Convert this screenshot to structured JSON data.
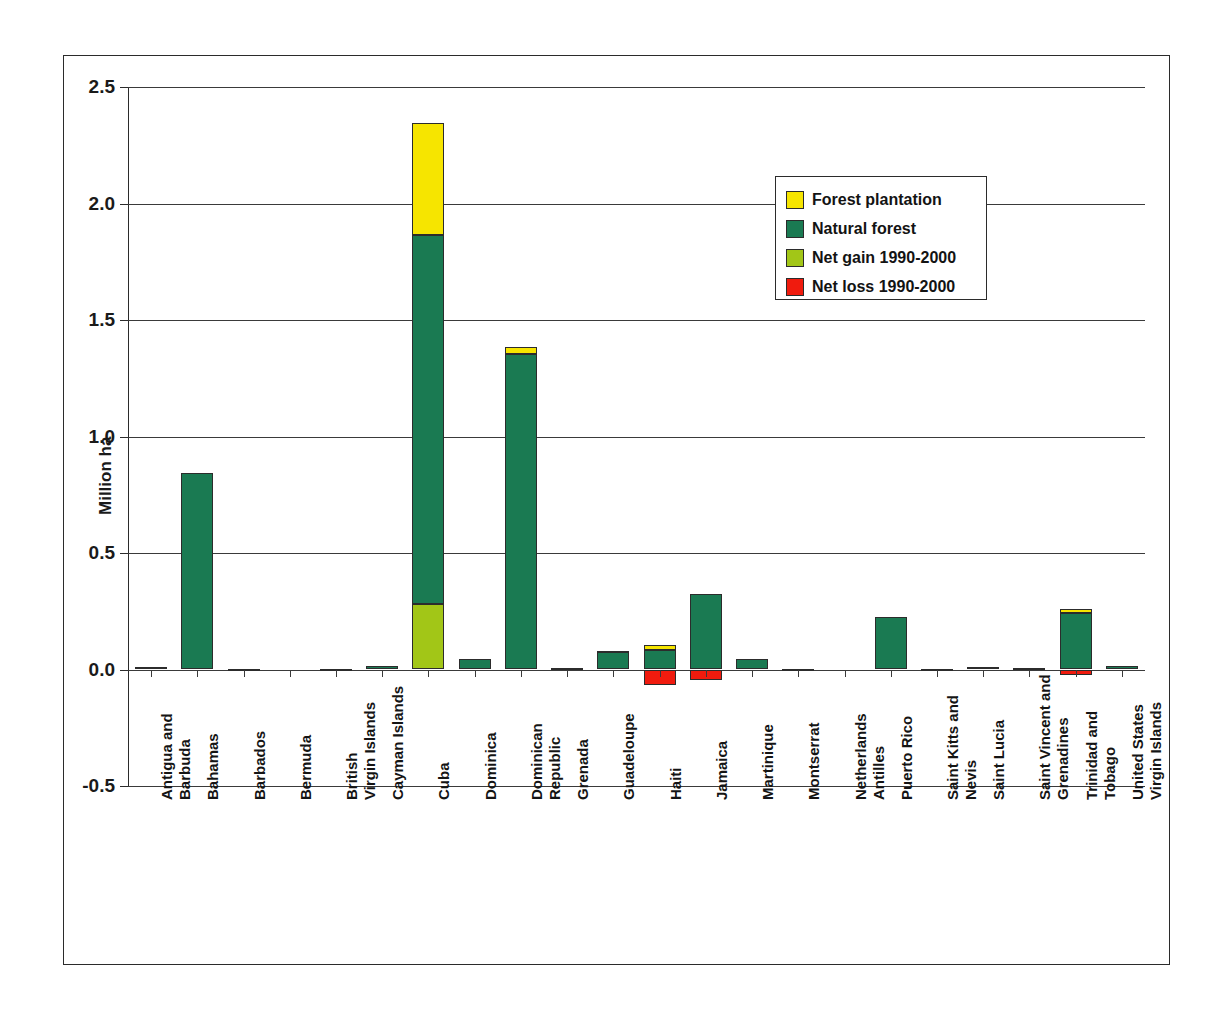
{
  "chart_data": {
    "type": "bar",
    "subtype": "stacked-with-negative",
    "title": "",
    "xlabel": "",
    "ylabel": "Million ha",
    "ylim": [
      -0.5,
      2.5
    ],
    "ytick_labels": [
      "2.5",
      "2.0",
      "1.5",
      "1.0",
      "0.5",
      "0.0",
      "-0.5"
    ],
    "ytick_values": [
      2.5,
      2.0,
      1.5,
      1.0,
      0.5,
      0.0,
      -0.5
    ],
    "grid": true,
    "legend_position": "upper right",
    "legend": [
      {
        "label": "Forest plantation",
        "color": "#f6e500"
      },
      {
        "label": "Natural forest",
        "color": "#1a7a52"
      },
      {
        "label": "Net gain 1990-2000",
        "color": "#a2c617"
      },
      {
        "label": "Net loss 1990-2000",
        "color": "#f01b0e"
      }
    ],
    "categories": [
      "Antigua and Barbuda",
      "Bahamas",
      "Barbados",
      "Bermuda",
      "British Virgin Islands",
      "Cayman Islands",
      "Cuba",
      "Dominica",
      "Dominican Republic",
      "Grenada",
      "Guadeloupe",
      "Haiti",
      "Jamaica",
      "Martinique",
      "Montserrat",
      "Netherlands Antilles",
      "Puerto Rico",
      "Saint Kitts and Nevis",
      "Saint Lucia",
      "Saint Vincent and Grenadines",
      "Trinidad and Tobago",
      "United States Virgin Islands"
    ],
    "category_label_lines": [
      [
        "Antigua and",
        "Barbuda"
      ],
      [
        "Bahamas"
      ],
      [
        "Barbados"
      ],
      [
        "Bermuda"
      ],
      [
        "British",
        "Virgin Islands"
      ],
      [
        "Cayman Islands"
      ],
      [
        "Cuba"
      ],
      [
        "Dominica"
      ],
      [
        "Dominican",
        "Republic"
      ],
      [
        "Grenada"
      ],
      [
        "Guadeloupe"
      ],
      [
        "Haiti"
      ],
      [
        "Jamaica"
      ],
      [
        "Martinique"
      ],
      [
        "Montserrat"
      ],
      [
        "Netherlands",
        "Antilles"
      ],
      [
        "Puerto Rico"
      ],
      [
        "Saint Kitts and",
        "Nevis"
      ],
      [
        "Saint Lucia"
      ],
      [
        "Saint Vincent and",
        "Grenadines"
      ],
      [
        "Trinidad and",
        "Tobago"
      ],
      [
        "United States",
        "Virgin Islands"
      ]
    ],
    "series": [
      {
        "name": "Natural forest",
        "color": "#1a7a52",
        "values": [
          0.009,
          0.842,
          0.002,
          0.001,
          0.003,
          0.013,
          1.585,
          0.046,
          1.352,
          0.005,
          0.075,
          0.085,
          0.325,
          0.047,
          0.003,
          0.001,
          0.227,
          0.004,
          0.009,
          0.006,
          0.244,
          0.013
        ]
      },
      {
        "name": "Forest plantation",
        "color": "#f6e500",
        "values": [
          0.0,
          0.0,
          0.0,
          0.0,
          0.0,
          0.0,
          0.482,
          0.0,
          0.03,
          0.0,
          0.003,
          0.02,
          0.0,
          0.0,
          0.0,
          0.0,
          0.0,
          0.0,
          0.0,
          0.0,
          0.015,
          0.0
        ]
      },
      {
        "name": "Net gain 1990-2000",
        "color": "#a2c617",
        "values": [
          0.0,
          0.0,
          0.0,
          0.0,
          0.0,
          0.0,
          0.28,
          0.0,
          0.0,
          0.0,
          0.0,
          0.0,
          0.0,
          0.0,
          0.0,
          0.0,
          0.0,
          0.0,
          0.0,
          0.0,
          0.0,
          0.0
        ]
      },
      {
        "name": "Net loss 1990-2000",
        "color": "#f01b0e",
        "values": [
          0.0,
          0.0,
          0.0,
          0.0,
          0.0,
          0.0,
          0.0,
          0.0,
          0.0,
          0.0,
          0.0,
          -0.065,
          -0.047,
          0.0,
          0.0,
          0.0,
          0.0,
          0.0,
          0.0,
          0.0,
          -0.022,
          0.0
        ]
      }
    ]
  }
}
